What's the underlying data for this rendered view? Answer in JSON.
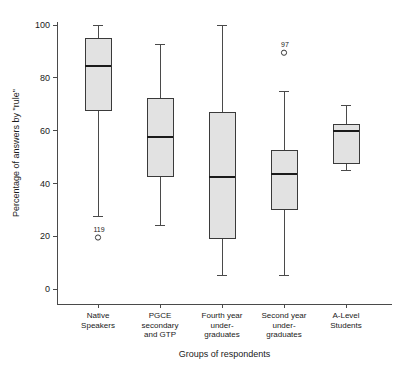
{
  "chart_data": {
    "type": "box",
    "title": "",
    "xlabel": "Groups of respondents",
    "ylabel": "Percentage of answers by \"rule\"",
    "ylim": [
      0,
      105
    ],
    "ytick_values": [
      0,
      20,
      40,
      60,
      80,
      100
    ],
    "ytick_labels": [
      "0",
      "20",
      "40",
      "60",
      "80",
      "100"
    ],
    "grid": false,
    "legend": "none",
    "categories": [
      "Native Speakers",
      "PGCE secondary and GTP",
      "Fourth year under-graduates",
      "Second year under-graduates",
      "A-Level Students"
    ],
    "category_label_lines": [
      [
        "Native",
        "Speakers"
      ],
      [
        "PGCE",
        "secondary",
        "and GTP"
      ],
      [
        "Fourth year",
        "under-",
        "graduates"
      ],
      [
        "Second year",
        "under-",
        "graduates"
      ],
      [
        "A-Level",
        "Students"
      ]
    ],
    "boxes": [
      {
        "category": "Native Speakers",
        "whisker_low": 27.5,
        "q1": 67.5,
        "median": 84.5,
        "q3": 95.0,
        "whisker_high": 100.0,
        "outliers": [
          {
            "value": 19.5,
            "label": "119"
          }
        ]
      },
      {
        "category": "PGCE secondary and GTP",
        "whisker_low": 24.0,
        "q1": 42.5,
        "median": 57.5,
        "q3": 72.0,
        "whisker_high": 92.5,
        "outliers": []
      },
      {
        "category": "Fourth year under-graduates",
        "whisker_low": 5.0,
        "q1": 19.0,
        "median": 42.5,
        "q3": 67.0,
        "whisker_high": 100.0,
        "outliers": []
      },
      {
        "category": "Second year under-graduates",
        "whisker_low": 5.0,
        "q1": 30.0,
        "median": 43.5,
        "q3": 52.5,
        "whisker_high": 75.0,
        "outliers": [
          {
            "value": 89.5,
            "label": "97"
          }
        ]
      },
      {
        "category": "A-Level Students",
        "whisker_low": 45.0,
        "q1": 47.5,
        "median": 60.0,
        "q3": 62.5,
        "whisker_high": 69.5,
        "outliers": []
      }
    ],
    "colors": {
      "box_fill": "#e2e2e2",
      "box_stroke": "#3a3a3a",
      "median": "#1a1a1a",
      "axis": "#4a4a4a",
      "text": "#1a1a1a",
      "background": "#ffffff"
    }
  }
}
